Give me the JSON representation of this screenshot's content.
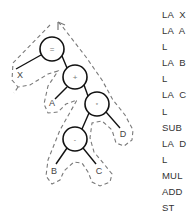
{
  "diagram": {
    "nodes": [
      {
        "id": "n_assign",
        "label": "=",
        "type": "operator",
        "cx": 52,
        "cy": 49
      },
      {
        "id": "n_add",
        "label": "+",
        "type": "operator",
        "cx": 75,
        "cy": 77
      },
      {
        "id": "n_mul",
        "label": "*",
        "type": "operator",
        "cx": 97,
        "cy": 104
      },
      {
        "id": "n_sub",
        "label": "-",
        "type": "operator",
        "cx": 75,
        "cy": 139
      }
    ],
    "leaves": [
      {
        "id": "leaf_x",
        "label": "X",
        "x": 20,
        "y": 78
      },
      {
        "id": "leaf_a",
        "label": "A",
        "x": 52,
        "y": 106
      },
      {
        "id": "leaf_d",
        "label": "D",
        "x": 123,
        "y": 137
      },
      {
        "id": "leaf_b",
        "label": "B",
        "x": 54,
        "y": 174
      },
      {
        "id": "leaf_c",
        "label": "C",
        "x": 99,
        "y": 174
      }
    ],
    "edges": [
      {
        "from": "n_assign",
        "to": "leaf_x"
      },
      {
        "from": "n_assign",
        "to": "n_add"
      },
      {
        "from": "n_add",
        "to": "leaf_a"
      },
      {
        "from": "n_add",
        "to": "n_mul"
      },
      {
        "from": "n_mul",
        "to": "n_sub"
      },
      {
        "from": "n_mul",
        "to": "leaf_d"
      },
      {
        "from": "n_sub",
        "to": "leaf_b"
      },
      {
        "from": "n_sub",
        "to": "leaf_c"
      }
    ],
    "traversal_path": "dashed outline enclosing tree, arrowhead at top"
  },
  "code_listing": {
    "lines": [
      "LA  X",
      "LA  A",
      "L",
      "LA  B",
      "L",
      "LA  C",
      "L",
      "SUB",
      "LA  D",
      "L",
      "MUL",
      "ADD",
      "ST"
    ]
  },
  "colors": {
    "line": "#111111",
    "dash": "#777777",
    "text": "#333333"
  }
}
